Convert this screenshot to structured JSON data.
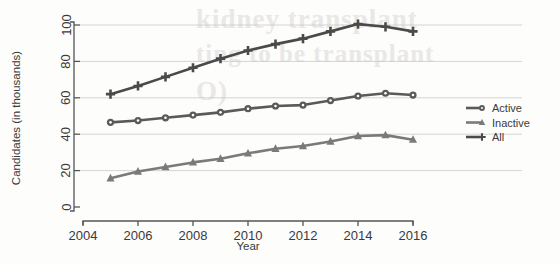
{
  "chart_data": {
    "type": "line",
    "title": "",
    "subtitle": "",
    "xlabel": "Year",
    "ylabel": "Candidates (in thousands)",
    "x": [
      2005,
      2006,
      2007,
      2008,
      2009,
      2010,
      2011,
      2012,
      2013,
      2014,
      2015,
      2016
    ],
    "xlim": [
      2004,
      2016
    ],
    "ylim": [
      0,
      100
    ],
    "xticks": [
      2004,
      2006,
      2008,
      2010,
      2012,
      2014,
      2016
    ],
    "xtick_labels": [
      "2004",
      "2006",
      "2008",
      "2010",
      "2012",
      "2014",
      "2016"
    ],
    "yticks": [
      0,
      20,
      40,
      60,
      80,
      100
    ],
    "ytick_labels": [
      "0",
      "20",
      "40",
      "60",
      "80",
      "100"
    ],
    "grid": true,
    "grid_axis": "y",
    "legend_position": "right",
    "series": [
      {
        "name": "Active",
        "marker": "circle",
        "color": "#5a5a5a",
        "values": [
          46.5,
          47.5,
          49,
          50.5,
          52,
          54,
          55.5,
          56,
          58.5,
          61,
          62.5,
          61.5
        ]
      },
      {
        "name": "Inactive",
        "marker": "triangle",
        "color": "#7a7a7a",
        "values": [
          15.8,
          19.5,
          22,
          24.5,
          26.5,
          29.5,
          32,
          33.5,
          36,
          39,
          39.5,
          37
        ]
      },
      {
        "name": "All",
        "marker": "plus",
        "color": "#4a4a4a",
        "values": [
          62,
          66.5,
          71.5,
          76.5,
          81.5,
          86,
          89.5,
          92.5,
          96.5,
          100.5,
          99,
          96.5
        ]
      }
    ]
  },
  "legend": {
    "entries": [
      {
        "label": "Active"
      },
      {
        "label": "Inactive"
      },
      {
        "label": "All"
      }
    ]
  },
  "background_bleed": {
    "line1": "kidney transplant",
    "line2": "ting to be transplant",
    "line3": "O)"
  }
}
